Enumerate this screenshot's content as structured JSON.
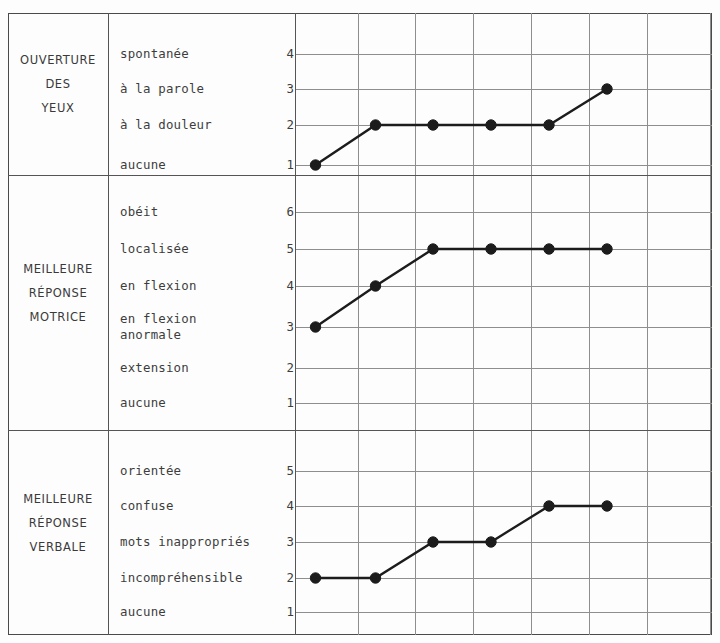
{
  "chart_data": {
    "type": "line",
    "title": "",
    "xlabel": "",
    "ylabel": "",
    "grid": true,
    "legend": "none",
    "x_columns": 7,
    "panels": [
      {
        "category": "eye-opening",
        "category_lines": [
          "OUVERTURE",
          "DES",
          "YEUX"
        ],
        "scale": [
          {
            "label": "spontanée",
            "score": "4"
          },
          {
            "label": "à la parole",
            "score": "3"
          },
          {
            "label": "à la douleur",
            "score": "2"
          },
          {
            "label": "aucune",
            "score": "1"
          }
        ],
        "ylim": [
          1,
          4
        ],
        "values": [
          1,
          2,
          2,
          2,
          2,
          3
        ],
        "x": [
          1,
          2,
          3,
          4,
          5,
          6
        ]
      },
      {
        "category": "best-motor-response",
        "category_lines": [
          "MEILLEURE",
          "RÉPONSE",
          "MOTRICE"
        ],
        "scale": [
          {
            "label": "obéit",
            "score": "6"
          },
          {
            "label": "localisée",
            "score": "5"
          },
          {
            "label": "en flexion",
            "score": "4"
          },
          {
            "label": "en flexion\nanormale",
            "score": "3"
          },
          {
            "label": "extension",
            "score": "2"
          },
          {
            "label": "aucune",
            "score": "1"
          }
        ],
        "ylim": [
          1,
          6
        ],
        "values": [
          3,
          4,
          5,
          5,
          5,
          5
        ],
        "x": [
          1,
          2,
          3,
          4,
          5,
          6
        ]
      },
      {
        "category": "best-verbal-response",
        "category_lines": [
          "MEILLEURE",
          "RÉPONSE",
          "VERBALE"
        ],
        "scale": [
          {
            "label": "orientée",
            "score": "5"
          },
          {
            "label": "confuse",
            "score": "4"
          },
          {
            "label": "mots inappropriés",
            "score": "3"
          },
          {
            "label": "incompréhensible",
            "score": "2"
          },
          {
            "label": "aucune",
            "score": "1"
          }
        ],
        "ylim": [
          1,
          5
        ],
        "values": [
          2,
          2,
          3,
          3,
          4,
          4
        ],
        "x": [
          1,
          2,
          3,
          4,
          5,
          6
        ]
      }
    ]
  },
  "colors": {
    "ink": "#1c1c1c",
    "rule": "#555555",
    "grid": "#8e8e8e",
    "paper": "#fdfdfd"
  }
}
